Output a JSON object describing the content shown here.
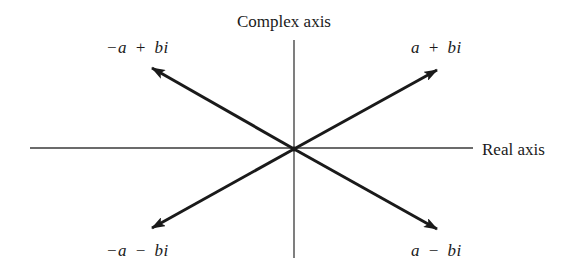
{
  "diagram": {
    "colors": {
      "ink": "#1a1a1a",
      "axis": "#3a3a3a",
      "background": "#ffffff"
    },
    "axes": {
      "vertical_label": "Complex axis",
      "horizontal_label": "Real axis"
    },
    "vectors": [
      {
        "id": "q1",
        "label": "a + bi",
        "quadrant": "upper-right"
      },
      {
        "id": "q2",
        "label": "−a + bi",
        "quadrant": "upper-left"
      },
      {
        "id": "q3",
        "label": "−a − bi",
        "quadrant": "lower-left"
      },
      {
        "id": "q4",
        "label": "a − bi",
        "quadrant": "lower-right"
      }
    ]
  }
}
